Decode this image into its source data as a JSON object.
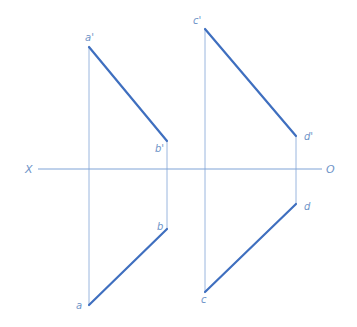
{
  "diagram": {
    "type": "orthographic-projection",
    "colors": {
      "line": "#3f6fbf",
      "projector": "#9ab6de",
      "axis": "#7ea3d6",
      "label": "#6f94c8"
    },
    "axis": {
      "left_label": "X",
      "right_label": "O",
      "y": 169,
      "x1": 38,
      "x2": 322
    },
    "points": {
      "a_prime": {
        "label": "a'",
        "x": 89,
        "y": 47
      },
      "b_prime": {
        "label": "b'",
        "x": 167,
        "y": 141
      },
      "a": {
        "label": "a",
        "x": 89,
        "y": 305
      },
      "b": {
        "label": "b",
        "x": 167,
        "y": 229
      },
      "c_prime": {
        "label": "c'",
        "x": 205,
        "y": 29
      },
      "d_prime": {
        "label": "d'",
        "x": 296,
        "y": 136
      },
      "c": {
        "label": "c",
        "x": 205,
        "y": 292
      },
      "d": {
        "label": "d",
        "x": 296,
        "y": 204
      }
    },
    "segments": [
      {
        "name": "a'b'",
        "from": "a_prime",
        "to": "b_prime"
      },
      {
        "name": "ab",
        "from": "a",
        "to": "b"
      },
      {
        "name": "c'd'",
        "from": "c_prime",
        "to": "d_prime"
      },
      {
        "name": "cd",
        "from": "c",
        "to": "d"
      }
    ]
  }
}
